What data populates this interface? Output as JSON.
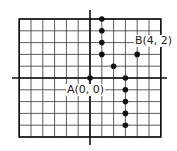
{
  "diagram": {
    "type": "coordinate-grid",
    "grid": {
      "x_min": -5,
      "x_max": 6,
      "y_min": -5,
      "y_max": 5
    },
    "points": [
      {
        "x": 1,
        "y": 5
      },
      {
        "x": 1,
        "y": 4
      },
      {
        "x": 1,
        "y": 3
      },
      {
        "x": 1,
        "y": 2
      },
      {
        "x": 2,
        "y": 1
      },
      {
        "x": 0,
        "y": 0,
        "label": "A(0, 0)"
      },
      {
        "x": 4,
        "y": 2,
        "label": "B(4, 2)"
      },
      {
        "x": 3,
        "y": 0
      },
      {
        "x": 3,
        "y": -1
      },
      {
        "x": 3,
        "y": -2
      },
      {
        "x": 3,
        "y": -3
      },
      {
        "x": 3,
        "y": -4
      }
    ]
  },
  "labels": {
    "a": "A(0, 0)",
    "b": "B(4, 2)"
  },
  "colors": {
    "grid": "#333333",
    "axis": "#111111",
    "point": "#111111"
  }
}
